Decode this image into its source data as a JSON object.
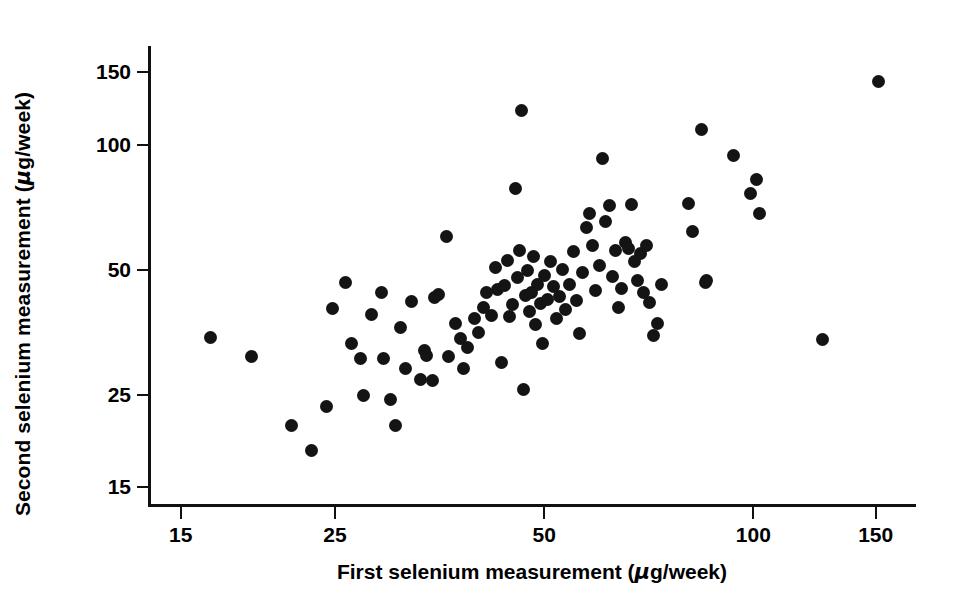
{
  "chart_data": {
    "type": "scatter",
    "title": "",
    "xlabel": "First selenium measurement (µg/week)",
    "ylabel": "Second selenium measurement (µg/week)",
    "xscale": "log",
    "yscale": "log",
    "xlim": [
      13.5,
      172
    ],
    "ylim": [
      13.6,
      172
    ],
    "xticks": [
      15,
      25,
      50,
      100,
      150
    ],
    "yticks": [
      15,
      25,
      50,
      100,
      150
    ],
    "xtick_labels": [
      "15",
      "25",
      "50",
      "100",
      "150"
    ],
    "ytick_labels": [
      "15",
      "25",
      "50",
      "100",
      "150"
    ],
    "grid": false,
    "legend": null,
    "marker": "filled-circle",
    "marker_color": "#141414",
    "n_points": 104,
    "points": [
      [
        16.6,
        34.2
      ],
      [
        19.0,
        30.8
      ],
      [
        21.7,
        21.0
      ],
      [
        23.2,
        18.3
      ],
      [
        24.4,
        23.3
      ],
      [
        24.9,
        40.2
      ],
      [
        26.0,
        46.5
      ],
      [
        26.5,
        33.0
      ],
      [
        27.3,
        30.4
      ],
      [
        27.6,
        24.8
      ],
      [
        28.3,
        38.8
      ],
      [
        29.3,
        44.0
      ],
      [
        29.5,
        30.5
      ],
      [
        30.2,
        24.2
      ],
      [
        30.7,
        21.0
      ],
      [
        31.2,
        36.1
      ],
      [
        31.7,
        28.8
      ],
      [
        32.3,
        41.8
      ],
      [
        33.3,
        27.1
      ],
      [
        33.8,
        31.8
      ],
      [
        34.0,
        31.0
      ],
      [
        34.6,
        26.9
      ],
      [
        34.9,
        42.7
      ],
      [
        35.4,
        43.4
      ],
      [
        36.3,
        59.8
      ],
      [
        36.6,
        30.8
      ],
      [
        37.4,
        36.9
      ],
      [
        38.0,
        34.1
      ],
      [
        38.4,
        28.8
      ],
      [
        38.9,
        32.3
      ],
      [
        39.8,
        38.1
      ],
      [
        40.3,
        35.2
      ],
      [
        41.0,
        40.3
      ],
      [
        41.5,
        43.8
      ],
      [
        42.2,
        38.6
      ],
      [
        42.7,
        50.3
      ],
      [
        43.0,
        44.7
      ],
      [
        43.6,
        29.8
      ],
      [
        44.0,
        45.6
      ],
      [
        44.5,
        52.4
      ],
      [
        44.7,
        38.4
      ],
      [
        45.2,
        41.0
      ],
      [
        45.6,
        78.0
      ],
      [
        46.0,
        47.8
      ],
      [
        46.3,
        55.4
      ],
      [
        46.6,
        120.0
      ],
      [
        46.8,
        25.6
      ],
      [
        47.1,
        43.2
      ],
      [
        47.4,
        49.5
      ],
      [
        47.8,
        39.5
      ],
      [
        48.1,
        44.0
      ],
      [
        48.5,
        53.6
      ],
      [
        48.8,
        36.8
      ],
      [
        49.1,
        46.0
      ],
      [
        49.5,
        41.4
      ],
      [
        49.9,
        33.0
      ],
      [
        50.3,
        48.3
      ],
      [
        50.8,
        42.2
      ],
      [
        51.2,
        52.0
      ],
      [
        51.7,
        45.4
      ],
      [
        52.3,
        38.0
      ],
      [
        52.8,
        43.0
      ],
      [
        53.4,
        50.0
      ],
      [
        53.9,
        40.0
      ],
      [
        54.6,
        46.0
      ],
      [
        55.2,
        55.0
      ],
      [
        55.8,
        42.0
      ],
      [
        56.4,
        35.0
      ],
      [
        57.0,
        49.0
      ],
      [
        57.7,
        63.0
      ],
      [
        58.3,
        68.0
      ],
      [
        58.9,
        57.0
      ],
      [
        59.5,
        44.5
      ],
      [
        60.2,
        51.0
      ],
      [
        60.8,
        92.0
      ],
      [
        61.5,
        65.0
      ],
      [
        62.2,
        71.0
      ],
      [
        62.9,
        48.0
      ],
      [
        63.5,
        55.5
      ],
      [
        64.2,
        40.5
      ],
      [
        64.9,
        45.0
      ],
      [
        65.6,
        58.0
      ],
      [
        66.3,
        56.0
      ],
      [
        67.0,
        71.5
      ],
      [
        67.6,
        52.0
      ],
      [
        68.3,
        47.0
      ],
      [
        69.0,
        54.5
      ],
      [
        69.7,
        44.0
      ],
      [
        70.4,
        57.0
      ],
      [
        71.2,
        41.5
      ],
      [
        72.0,
        34.5
      ],
      [
        73.0,
        37.0
      ],
      [
        74.0,
        46.0
      ],
      [
        81.0,
        72.0
      ],
      [
        82.0,
        61.5
      ],
      [
        84.5,
        108.0
      ],
      [
        85.5,
        46.5
      ],
      [
        86.0,
        47.0
      ],
      [
        94.0,
        94.0
      ],
      [
        99.5,
        76.0
      ],
      [
        101.5,
        82.0
      ],
      [
        102.5,
        68.0
      ],
      [
        126.0,
        33.8
      ],
      [
        152.0,
        141.0
      ]
    ]
  }
}
